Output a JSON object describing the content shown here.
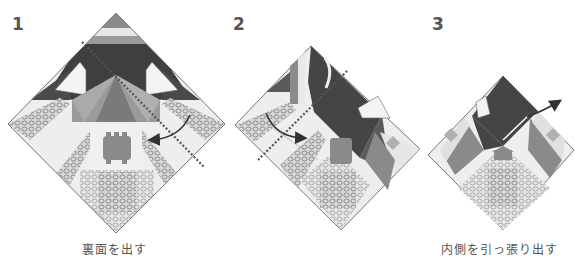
{
  "steps": [
    {
      "number": "1",
      "caption": "裏面を出す"
    },
    {
      "number": "2",
      "caption": ""
    },
    {
      "number": "3",
      "caption": "内側を引っ張り出す"
    }
  ],
  "colors": {
    "dark": "#4a4a4a",
    "mid": "#8a8a8a",
    "light": "#bdbdbd",
    "paper": "#eeeeee",
    "outline": "#777777",
    "fold_line": "#555555",
    "arrow": "#333333"
  }
}
